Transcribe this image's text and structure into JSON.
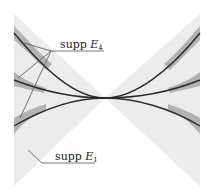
{
  "figure": {
    "labels": {
      "supp_e4": {
        "text": "supp ",
        "symbol": "E",
        "subscript": "4"
      },
      "supp_e1": {
        "text": "supp ",
        "symbol": "E",
        "subscript": "1"
      }
    },
    "colors": {
      "background": "#ffffff",
      "light_region": "#ececec",
      "dark_band": "#a8a8a8",
      "curve": "#2a2a2a",
      "leader": "#555555"
    },
    "center": [
      105,
      98
    ]
  }
}
